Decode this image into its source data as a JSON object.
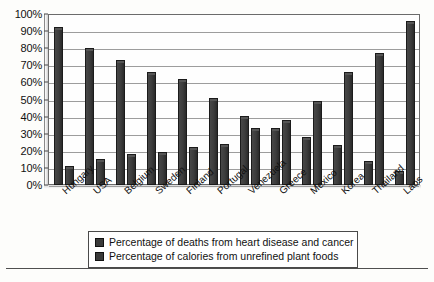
{
  "chart_data": {
    "type": "bar",
    "title": "",
    "subtitle": "",
    "xlabel": "",
    "ylabel": "",
    "ylim": [
      0,
      100
    ],
    "ytick_step": 10,
    "grid": true,
    "legend_position": "bottom",
    "categories": [
      "Hungary",
      "USA",
      "Belgium",
      "Sweden",
      "Finland",
      "Portugal",
      "Venezuela",
      "Greece",
      "Mexico",
      "Korea",
      "Thailand",
      "Laos"
    ],
    "ytick_labels": [
      "100%",
      "90%",
      "80%",
      "70%",
      "60%",
      "50%",
      "40%",
      "30%",
      "20%",
      "10%",
      "0%"
    ],
    "ytick_values": [
      100,
      90,
      80,
      70,
      60,
      50,
      40,
      30,
      20,
      10,
      0
    ],
    "series": [
      {
        "name": "Percentage of deaths from heart disease and cancer",
        "color": "#3a3a3a",
        "values": [
          91,
          79,
          72,
          65,
          61,
          50,
          39,
          32,
          27,
          22,
          13,
          7
        ]
      },
      {
        "name": "Percentage of calories from unrefined plant foods",
        "color": "#3a3a3a",
        "values": [
          10,
          14,
          17,
          18,
          21,
          23,
          32,
          37,
          48,
          65,
          76,
          95
        ]
      }
    ]
  },
  "legend": {
    "items": [
      {
        "label": "Percentage of deaths from heart disease and cancer",
        "swatch": "legend-swatch-series-1"
      },
      {
        "label": "Percentage of calories from unrefined plant foods",
        "swatch": "legend-swatch-series-2"
      }
    ]
  }
}
